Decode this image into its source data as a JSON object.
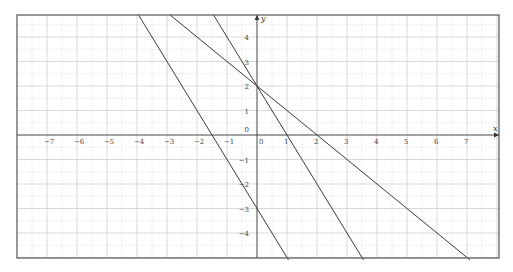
{
  "chart_data": {
    "type": "line",
    "title": "",
    "xlabel": "x",
    "ylabel": "y",
    "xlim": [
      -7.97,
      8.1
    ],
    "ylim": [
      -5.1,
      4.9
    ],
    "grid": true,
    "grid_minor_step": 0.5,
    "x_ticks": [
      -7,
      -6,
      -5,
      -4,
      -3,
      -2,
      -1,
      0,
      1,
      2,
      3,
      4,
      5,
      6,
      7
    ],
    "y_ticks": [
      -4,
      -3,
      -2,
      -1,
      0,
      1,
      2,
      3,
      4
    ],
    "x_tick_labels": [
      "-7",
      "-6",
      "-5",
      "-4",
      "-3",
      "-2",
      "-1",
      "0",
      "1",
      "2",
      "3",
      "4",
      "5",
      "6",
      "7"
    ],
    "y_tick_labels": [
      "-4",
      "-3",
      "-2",
      "-1",
      "0",
      "1",
      "2",
      "3",
      "4"
    ],
    "legend": null,
    "series": [
      {
        "name": "y = -2x - 3",
        "slope": -2,
        "intercept": -3,
        "x": [
          -3.95,
          1.05
        ],
        "y": [
          4.9,
          -5.1
        ]
      },
      {
        "name": "y = -x + 2",
        "slope": -1,
        "intercept": 2,
        "x": [
          -2.9,
          7.1
        ],
        "y": [
          4.9,
          -5.1
        ]
      },
      {
        "name": "y = -2x + 2",
        "slope": -2,
        "intercept": 2,
        "x": [
          -1.45,
          3.55
        ],
        "y": [
          4.9,
          -5.1
        ]
      }
    ],
    "annotations": [
      "Lines y=-x+2 and y=-2x+2 intersect at (0, 2)"
    ]
  },
  "colors": {
    "line": "#3a3a3a",
    "grid": "#cfcfcf",
    "frame": "#555555",
    "axis": "#333333"
  }
}
